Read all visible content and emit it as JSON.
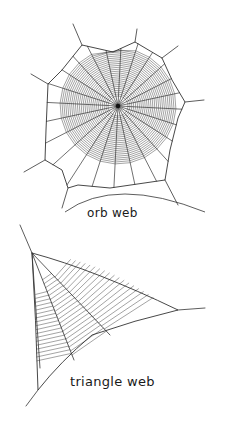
{
  "figure": {
    "background": "#ffffff",
    "stroke_color": "#333333",
    "labels": {
      "orb": "orb web",
      "triangle": "triangle web"
    },
    "orb_web": {
      "center": [
        118,
        106
      ],
      "radial_count": 24,
      "spiral_radius": 58,
      "spiral_rings": 26,
      "hub_radius": 6
    },
    "triangle_web": {
      "apex": [
        32,
        253
      ],
      "right_tip": [
        178,
        310
      ],
      "bottom_left": [
        38,
        390
      ]
    }
  }
}
